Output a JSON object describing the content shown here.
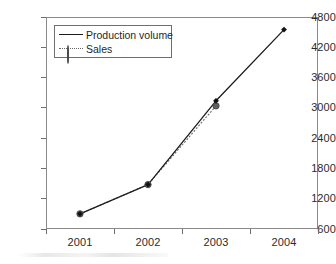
{
  "chart_data": {
    "type": "line",
    "title": "",
    "xlabel": "",
    "ylabel": "",
    "categories": [
      "2001",
      "2002",
      "2003",
      "2004"
    ],
    "ylim": [
      600,
      4800
    ],
    "yticks": [
      600,
      1200,
      1800,
      2400,
      3000,
      3600,
      4200,
      4800
    ],
    "ytick_labels": [
      "600",
      "1200",
      "1800",
      "2400",
      "3000",
      "3600",
      "4200",
      "4800"
    ],
    "grid": true,
    "legend_position": "upper-left-inside",
    "series": [
      {
        "name": "Production volume",
        "values": [
          900,
          1480,
          3140,
          4550
        ],
        "line_style": "solid",
        "marker": "diamond",
        "color": "#1c1c1c"
      },
      {
        "name": "Sales",
        "values": [
          900,
          1480,
          3040,
          null
        ],
        "line_style": "dotted",
        "marker": "circle",
        "color": "#6a6a6a"
      }
    ]
  },
  "legend": {
    "items": [
      {
        "label": "Production volume"
      },
      {
        "label": "Sales"
      }
    ]
  },
  "axes": {
    "y_labels": [
      "4800",
      "4200",
      "3600",
      "3000",
      "2400",
      "1800",
      "1200",
      "600"
    ],
    "x_labels": [
      "2001",
      "2002",
      "2003",
      "2004"
    ]
  },
  "colors": {
    "production_line": "#1c1c1c",
    "sales_line": "#6a6a6a",
    "grid": "#9a9a9a",
    "frame": "#8a8a8a",
    "text": "#2b2b2b",
    "background": "#ffffff"
  }
}
